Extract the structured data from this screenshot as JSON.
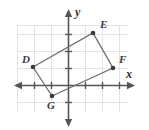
{
  "figure": {
    "kind": "coordinate-plane-quadrilateral",
    "width": 149,
    "height": 130,
    "background_color": "#ffffff",
    "grid_color": "#e2e0ea",
    "axis_color": "#555555",
    "shape_stroke_color": "#6e6e6e",
    "vertex_dot_color": "#3a3a3a",
    "label_color": "#3b3b3b"
  },
  "axes": {
    "x_label": "x",
    "y_label": "y",
    "origin_px": {
      "x": 68,
      "y": 85
    },
    "unit_px": 17,
    "x_range": [
      -3.2,
      4.0
    ],
    "y_range": [
      -2.6,
      4.2
    ],
    "grid": "on",
    "tick_marks": "on",
    "tick_labels": "none",
    "arrowheads": [
      "left",
      "right",
      "up",
      "down"
    ]
  },
  "chart_data": {
    "type": "scatter",
    "title": "",
    "xlabel": "x",
    "ylabel": "y",
    "xlim": [
      -3.2,
      4.0
    ],
    "ylim": [
      -2.6,
      4.2
    ],
    "grid": true,
    "legend": "none",
    "shape": {
      "name": "DEFG",
      "closed": true,
      "vertex_order": [
        "D",
        "E",
        "F",
        "G"
      ]
    },
    "points": [
      {
        "label": "D",
        "x": -2.0,
        "y": 1.0,
        "px": 33,
        "py": 67,
        "label_dx": -11,
        "label_dy": -13
      },
      {
        "label": "E",
        "x": 1.5,
        "y": 3.0,
        "px": 93,
        "py": 33,
        "label_dx": 7,
        "label_dy": -14
      },
      {
        "label": "F",
        "x": 2.6,
        "y": 1.0,
        "px": 113,
        "py": 68,
        "label_dx": 6,
        "label_dy": -14
      },
      {
        "label": "G",
        "x": -1.0,
        "y": -0.6,
        "px": 52,
        "py": 96,
        "label_dx": -5,
        "label_dy": 4
      }
    ],
    "edges": [
      {
        "from": "D",
        "to": "E"
      },
      {
        "from": "E",
        "to": "F"
      },
      {
        "from": "F",
        "to": "G"
      },
      {
        "from": "G",
        "to": "D"
      }
    ]
  },
  "labels": {
    "d": "D",
    "e": "E",
    "f": "F",
    "g": "G",
    "x_axis": "x",
    "y_axis": "y"
  }
}
